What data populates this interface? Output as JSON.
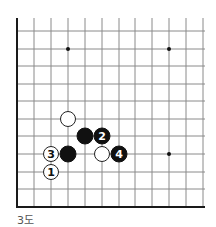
{
  "diagram": {
    "caption": "3도",
    "grid": {
      "cols_x": [
        17,
        34,
        51,
        68,
        85,
        102,
        119,
        135,
        152,
        169,
        186,
        203
      ],
      "rows_y": [
        31,
        49,
        66,
        84,
        101,
        119,
        136,
        154,
        172,
        189,
        207
      ],
      "top_y": 18,
      "right_x": 205,
      "left_edge_x": 17,
      "bottom_edge_y": 207,
      "line_color": "#8a8a8a",
      "edge_color": "#1a1a1a"
    },
    "star_points": [
      {
        "x": 68,
        "y": 49
      },
      {
        "x": 169,
        "y": 49
      },
      {
        "x": 169,
        "y": 154
      }
    ],
    "stones": [
      {
        "color": "white",
        "x": 68,
        "y": 119,
        "label": ""
      },
      {
        "color": "black",
        "x": 85,
        "y": 136,
        "label": ""
      },
      {
        "color": "black",
        "x": 102,
        "y": 136,
        "label": "2"
      },
      {
        "color": "black",
        "x": 68,
        "y": 154,
        "label": ""
      },
      {
        "color": "white",
        "x": 51,
        "y": 154,
        "label": "3"
      },
      {
        "color": "white",
        "x": 102,
        "y": 154,
        "label": ""
      },
      {
        "color": "black",
        "x": 119,
        "y": 154,
        "label": "4"
      },
      {
        "color": "white",
        "x": 51,
        "y": 172,
        "label": "1"
      }
    ],
    "stone_radius": 8
  }
}
